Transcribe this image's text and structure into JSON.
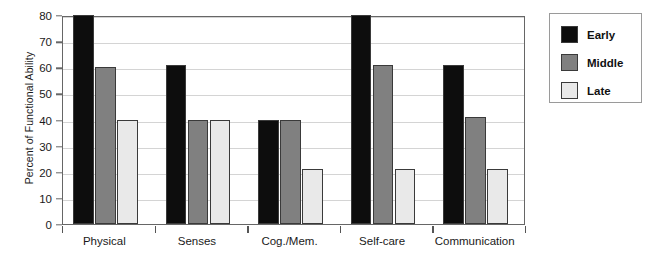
{
  "chart_data": {
    "type": "bar",
    "title": "",
    "subtitle": "",
    "xlabel": "",
    "ylabel": "Percent of Functional Ability",
    "ylim": [
      0,
      80
    ],
    "ytick_step": 10,
    "yticks": [
      0,
      10,
      20,
      30,
      40,
      50,
      60,
      70,
      80
    ],
    "ytick_labels": [
      "0",
      "10",
      "20",
      "30",
      "40",
      "50",
      "60",
      "70",
      "80"
    ],
    "grid": true,
    "grid_axis": "y",
    "legend_position": "right-outside",
    "categories": [
      "Physical",
      "Senses",
      "Cog./Mem.",
      "Self-care",
      "Communication"
    ],
    "series": [
      {
        "name": "Early",
        "color": "#0d0d0d",
        "values": [
          80,
          61,
          40,
          80,
          61
        ]
      },
      {
        "name": "Middle",
        "color": "#808080",
        "values": [
          60,
          40,
          40,
          61,
          41
        ]
      },
      {
        "name": "Late",
        "color": "#e9e9e9",
        "values": [
          40,
          40,
          21,
          21,
          21
        ]
      }
    ],
    "annotations": []
  },
  "legend": {
    "items": [
      {
        "label": "Early",
        "color": "#0d0d0d"
      },
      {
        "label": "Middle",
        "color": "#808080"
      },
      {
        "label": "Late",
        "color": "#e9e9e9"
      }
    ]
  },
  "axes": {
    "y_title": "Percent of Functional Ability",
    "frame_color": "#666666",
    "gridline_color": "#d4d4d4"
  }
}
